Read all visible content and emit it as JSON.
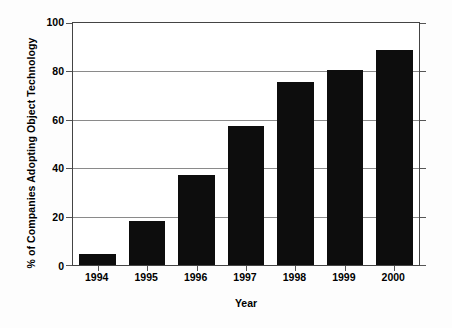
{
  "chart_data": {
    "type": "bar",
    "title": "",
    "xlabel": "Year",
    "ylabel": "% of Companies Adopting Object Technology",
    "categories": [
      "1994",
      "1995",
      "1996",
      "1997",
      "1998",
      "1999",
      "2000"
    ],
    "values": [
      4.5,
      18,
      37,
      57.5,
      75.5,
      80.5,
      89
    ],
    "ylim": [
      0,
      100
    ],
    "yticks": [
      0,
      20,
      40,
      60,
      80,
      100
    ],
    "ytick_labels": [
      "0",
      "20",
      "40",
      "60",
      "80",
      "100"
    ],
    "grid": true,
    "grid_axis": "y",
    "legend": null,
    "legend_position": "none",
    "bar_color": "#0d0d0d",
    "grid_color": "#8a8a8a",
    "frame_color": "#444444",
    "background_color": "#ffffff"
  }
}
